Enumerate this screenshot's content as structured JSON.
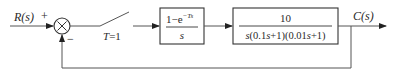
{
  "diagram": {
    "type": "sampled-data closed-loop control system block diagram",
    "input": {
      "label": "R(s)"
    },
    "summing_junction": {
      "plus_sign": "+",
      "minus_sign": "−",
      "symbol": "×"
    },
    "sampler": {
      "label": "T=1"
    },
    "blocks": [
      {
        "name": "zero-order-hold",
        "numerator": "1−e",
        "numerator_exponent": "−Ts",
        "denominator": "s"
      },
      {
        "name": "plant",
        "numerator": "10",
        "denominator": "s(0.1s+1)(0.01s+1)"
      }
    ],
    "output": {
      "label": "C(s)"
    },
    "feedback": {
      "type": "unity negative feedback"
    }
  },
  "colors": {
    "line": "#555555",
    "text": "#2a2a2a",
    "background": "#ffffff"
  }
}
